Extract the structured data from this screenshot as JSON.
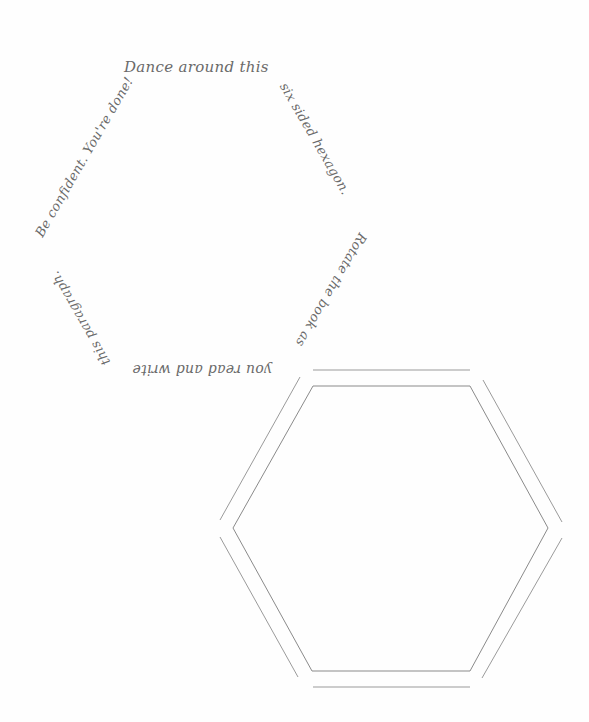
{
  "worksheet": {
    "text_hexagon": {
      "segments": [
        {
          "side": "top",
          "text": "Dance around this"
        },
        {
          "side": "upper-right",
          "text": "six sided hexagon."
        },
        {
          "side": "lower-right",
          "text": "Rotate the book as"
        },
        {
          "side": "bottom",
          "text": "you read and write"
        },
        {
          "side": "lower-left",
          "text": "this paragraph."
        },
        {
          "side": "upper-left",
          "text": "Be confident. You're done!"
        }
      ]
    },
    "practice_hexagon": {
      "stroke_color": "#8a8a8a"
    },
    "ink_color": "#6a6a6a"
  }
}
